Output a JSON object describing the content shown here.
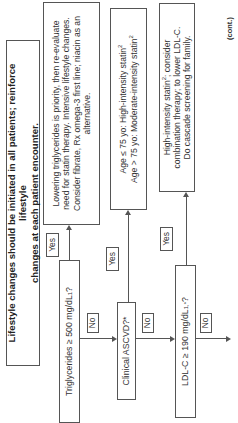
{
  "header": {
    "lifestyle_line1": "Lifestyle changes should be initiated in all patients; reinforce lifestyle",
    "lifestyle_line2": "changes at each patient encounter."
  },
  "questions": {
    "triglycerides": {
      "text": "Triglycerides ≥ 500 mg/dL",
      "sup": "1",
      "suffix": "?"
    },
    "ascvd": {
      "text": "Clinical ASCVD?*"
    },
    "ldl": {
      "text": "LDL-C ≥ 190 mg/dL",
      "sup": "1,*",
      "suffix": "?"
    }
  },
  "results": {
    "triglycerides": {
      "line1": "Lowering triglycerides is priority, then re-evaluate",
      "line2": "need for statin therapy. Intensive lifestyle changes.",
      "line3": "Consider fibrate, Rx omega-3 first line; niacin as an",
      "line4": "alternative."
    },
    "ascvd": {
      "line1": "Age ≤ 75 yo: High-intensity statin",
      "line1_sup": "2",
      "line2": "Age > 75 yo: Moderate-intensity statin",
      "line2_sup": "2"
    },
    "ldl": {
      "line1a": "High-intensity statin",
      "line1_sup": "2",
      "line1b": "; consider",
      "line2": "combination therapy; to lower LDL-C.",
      "line3": "Do cascade screening for family."
    }
  },
  "labels": {
    "yes": "Yes",
    "no": "No"
  },
  "footer": {
    "cont": "(cont.)"
  }
}
